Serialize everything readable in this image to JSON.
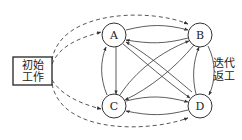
{
  "diagram": {
    "start_box": {
      "line1": "初始",
      "line2": "工作"
    },
    "nodes": [
      {
        "id": "A",
        "label": "A"
      },
      {
        "id": "B",
        "label": "B"
      },
      {
        "id": "C",
        "label": "C"
      },
      {
        "id": "D",
        "label": "D"
      }
    ],
    "side_label": {
      "line1": "迭代",
      "line2": "返工"
    },
    "edges": {
      "dashed_from_start": [
        "A",
        "B",
        "C",
        "D"
      ],
      "solid_bidirectional": [
        "A-B",
        "A-C",
        "A-D",
        "B-C",
        "B-D",
        "C-D"
      ]
    },
    "colors": {
      "stroke": "#333333",
      "background": "#ffffff"
    }
  }
}
